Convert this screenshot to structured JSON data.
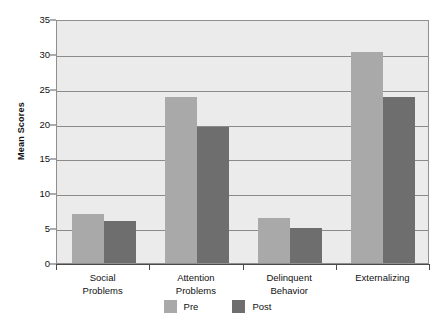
{
  "chart_data": {
    "type": "bar",
    "title": "",
    "xlabel": "",
    "ylabel": "Mean Scores",
    "ylim": [
      0,
      35
    ],
    "yticks": [
      0,
      5,
      10,
      15,
      20,
      25,
      30,
      35
    ],
    "grid": true,
    "legend_position": "bottom",
    "categories": [
      "Social\nProblems",
      "Attention\nProblems",
      "Delinquent\nBehavior",
      "Externalizing"
    ],
    "category_lines": [
      [
        "Social",
        "Problems"
      ],
      [
        "Attention",
        "Problems"
      ],
      [
        "Delinquent",
        "Behavior"
      ],
      [
        "Externalizing"
      ]
    ],
    "series": [
      {
        "name": "Pre",
        "color": "#a9a9a9",
        "values": [
          7.0,
          23.8,
          6.5,
          30.3
        ]
      },
      {
        "name": "Post",
        "color": "#6e6e6e",
        "values": [
          6.0,
          19.5,
          5.0,
          23.8
        ]
      }
    ]
  },
  "colors": {
    "pre": "#a9a9a9",
    "post": "#6e6e6e",
    "plot_background": "#ebebeb",
    "gridline": "#8a8a8a",
    "axis": "#4a4a4a",
    "text": "#111111"
  }
}
